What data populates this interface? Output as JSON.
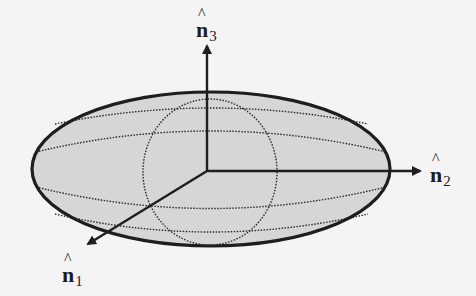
{
  "figure": {
    "type": "ellipsoid-principal-axes",
    "colors": {
      "background": "#f4f4f4",
      "ellipsoid_fill": "#d6d6d6",
      "stroke": "#1e1e1e"
    },
    "axes": [
      {
        "id": "n1",
        "base": "n",
        "hat": "^",
        "subscript": "1"
      },
      {
        "id": "n2",
        "base": "n",
        "hat": "^",
        "subscript": "2"
      },
      {
        "id": "n3",
        "base": "n",
        "hat": "^",
        "subscript": "3"
      }
    ]
  }
}
